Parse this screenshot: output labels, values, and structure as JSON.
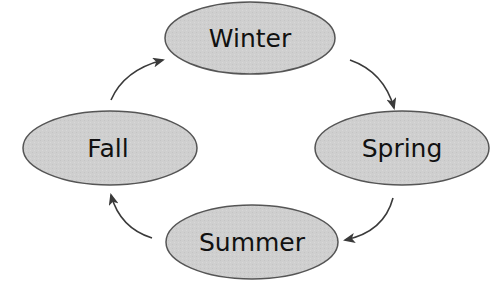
{
  "diagram": {
    "type": "cycle",
    "colors": {
      "node_fill": "#cfcfcf",
      "node_stroke": "#555555",
      "arrow": "#3a3a3a",
      "text": "#111111"
    },
    "nodes": [
      {
        "id": "winter",
        "label": "Winter",
        "cx": 250,
        "cy": 38,
        "rx": 85,
        "ry": 38
      },
      {
        "id": "spring",
        "label": "Spring",
        "cx": 402,
        "cy": 148,
        "rx": 88,
        "ry": 37
      },
      {
        "id": "summer",
        "label": "Summer",
        "cx": 250,
        "cy": 242,
        "rx": 87,
        "ry": 38
      },
      {
        "id": "fall",
        "label": "Fall",
        "cx": 110,
        "cy": 148,
        "rx": 87,
        "ry": 37
      }
    ],
    "edges": [
      {
        "from": "Winter",
        "to": "Spring"
      },
      {
        "from": "Spring",
        "to": "Summer"
      },
      {
        "from": "Summer",
        "to": "Fall"
      },
      {
        "from": "Fall",
        "to": "Winter"
      }
    ]
  }
}
